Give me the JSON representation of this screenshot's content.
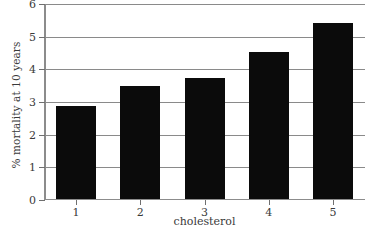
{
  "chart_data": {
    "type": "bar",
    "title": "",
    "subtitle": "",
    "xlabel": "cholesterol",
    "ylabel": "% mortality at 10 years",
    "categories": [
      "1",
      "2",
      "3",
      "4",
      "5"
    ],
    "values": [
      2.85,
      3.45,
      3.7,
      4.5,
      5.4
    ],
    "series": [
      {
        "name": "% mortality at 10 years",
        "values": [
          2.85,
          3.45,
          3.7,
          4.5,
          5.4
        ]
      }
    ],
    "ylim": [
      0,
      6
    ],
    "y_ticks": [
      "0",
      "1",
      "2",
      "3",
      "4",
      "5",
      "6"
    ],
    "y_tick_values": [
      0,
      1,
      2,
      3,
      4,
      5,
      6
    ],
    "x_ticks": [
      "1",
      "2",
      "3",
      "4",
      "5"
    ],
    "grid": "horizontal",
    "legend": "none",
    "bar_color": "#0b0b0b",
    "axis_color": "#8c8c8c",
    "grid_color": "#8a8a8a",
    "background_color": "#ffffff",
    "annotations": []
  }
}
